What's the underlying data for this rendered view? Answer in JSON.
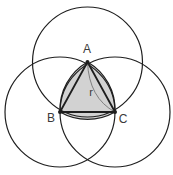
{
  "diagram": {
    "colors": {
      "background": "#ffffff",
      "stroke": "#1e1e1e",
      "fill": "#d2d2d2",
      "radius_line": "#6a6a6a",
      "label": "#3a3a3a"
    },
    "points": [
      {
        "id": "A",
        "label": "A",
        "x": 87.5,
        "y": 62,
        "label_x": 87,
        "label_y": 53
      },
      {
        "id": "B",
        "label": "B",
        "x": 60,
        "y": 112,
        "label_x": 51,
        "label_y": 122
      },
      {
        "id": "C",
        "label": "C",
        "x": 115,
        "y": 112,
        "label_x": 123,
        "label_y": 123
      }
    ],
    "circles": [
      {
        "center": "A",
        "cx": 87.5,
        "cy": 62,
        "r": 55
      },
      {
        "center": "B",
        "cx": 60,
        "cy": 112,
        "r": 55
      },
      {
        "center": "C",
        "cx": 115,
        "cy": 112,
        "r": 55
      }
    ],
    "radius_label": {
      "text": "r",
      "x": 91,
      "y": 96
    }
  }
}
